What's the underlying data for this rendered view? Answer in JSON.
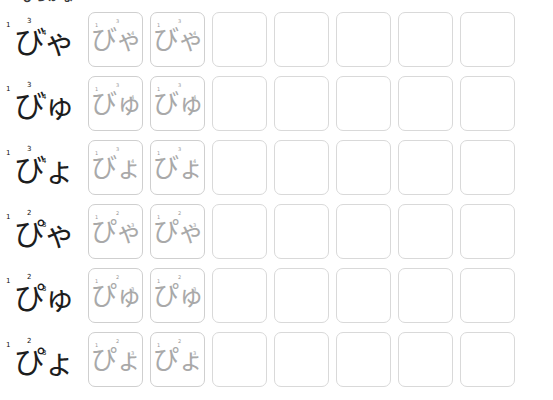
{
  "document": {
    "type": "hiragana-tracing-worksheet",
    "title_partial": "ひらがな",
    "script": "hiragana",
    "category": "youon with dakuten and handakuten",
    "columns_total": 7,
    "columns_traced": 2,
    "columns_blank": 5
  },
  "colors": {
    "label_ink": "#1d1d1d",
    "trace_ink": "#a9a9a9",
    "cell_border": "#d9d9d9",
    "background": "#ffffff",
    "stroke_number": "#2b2b2b"
  },
  "rows": [
    {
      "label": "びゃ",
      "romaji": "bya",
      "stroke_numbers": [
        "1",
        "3",
        "4"
      ],
      "cells": [
        {
          "glyph": "びゃ",
          "state": "traced"
        },
        {
          "glyph": "びゃ",
          "state": "traced"
        },
        {
          "glyph": "",
          "state": "blank"
        },
        {
          "glyph": "",
          "state": "blank"
        },
        {
          "glyph": "",
          "state": "blank"
        },
        {
          "glyph": "",
          "state": "blank"
        },
        {
          "glyph": "",
          "state": "blank"
        }
      ]
    },
    {
      "label": "びゅ",
      "romaji": "byu",
      "stroke_numbers": [
        "1",
        "3",
        "4"
      ],
      "cells": [
        {
          "glyph": "びゅ",
          "state": "traced"
        },
        {
          "glyph": "びゅ",
          "state": "traced"
        },
        {
          "glyph": "",
          "state": "blank"
        },
        {
          "glyph": "",
          "state": "blank"
        },
        {
          "glyph": "",
          "state": "blank"
        },
        {
          "glyph": "",
          "state": "blank"
        },
        {
          "glyph": "",
          "state": "blank"
        }
      ]
    },
    {
      "label": "びょ",
      "romaji": "byo",
      "stroke_numbers": [
        "1",
        "3",
        "4"
      ],
      "cells": [
        {
          "glyph": "びょ",
          "state": "traced"
        },
        {
          "glyph": "びょ",
          "state": "traced"
        },
        {
          "glyph": "",
          "state": "blank"
        },
        {
          "glyph": "",
          "state": "blank"
        },
        {
          "glyph": "",
          "state": "blank"
        },
        {
          "glyph": "",
          "state": "blank"
        },
        {
          "glyph": "",
          "state": "blank"
        }
      ]
    },
    {
      "label": "ぴゃ",
      "romaji": "pya",
      "stroke_numbers": [
        "1",
        "2",
        "3"
      ],
      "cells": [
        {
          "glyph": "ぴゃ",
          "state": "traced"
        },
        {
          "glyph": "ぴゃ",
          "state": "traced"
        },
        {
          "glyph": "",
          "state": "blank"
        },
        {
          "glyph": "",
          "state": "blank"
        },
        {
          "glyph": "",
          "state": "blank"
        },
        {
          "glyph": "",
          "state": "blank"
        },
        {
          "glyph": "",
          "state": "blank"
        }
      ]
    },
    {
      "label": "ぴゅ",
      "romaji": "pyu",
      "stroke_numbers": [
        "1",
        "2",
        "3"
      ],
      "cells": [
        {
          "glyph": "ぴゅ",
          "state": "traced"
        },
        {
          "glyph": "ぴゅ",
          "state": "traced"
        },
        {
          "glyph": "",
          "state": "blank"
        },
        {
          "glyph": "",
          "state": "blank"
        },
        {
          "glyph": "",
          "state": "blank"
        },
        {
          "glyph": "",
          "state": "blank"
        },
        {
          "glyph": "",
          "state": "blank"
        }
      ]
    },
    {
      "label": "ぴょ",
      "romaji": "pyo",
      "stroke_numbers": [
        "1",
        "2",
        "3"
      ],
      "cells": [
        {
          "glyph": "ぴょ",
          "state": "traced"
        },
        {
          "glyph": "ぴょ",
          "state": "traced"
        },
        {
          "glyph": "",
          "state": "blank"
        },
        {
          "glyph": "",
          "state": "blank"
        },
        {
          "glyph": "",
          "state": "blank"
        },
        {
          "glyph": "",
          "state": "blank"
        },
        {
          "glyph": "",
          "state": "blank"
        }
      ]
    }
  ]
}
